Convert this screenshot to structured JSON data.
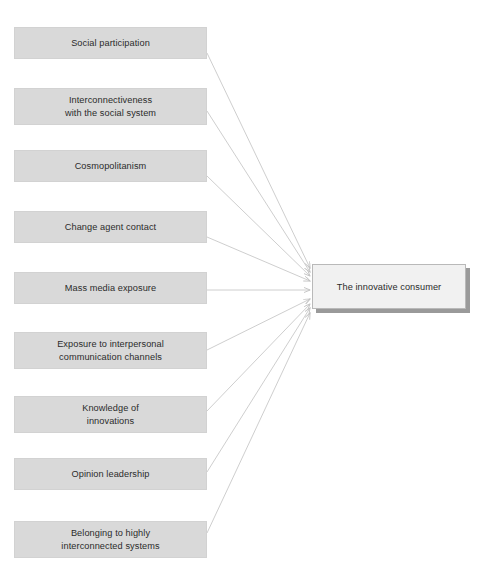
{
  "diagram": {
    "type": "convergent-arrow-diagram",
    "title": "The innovative consumer",
    "colors": {
      "antecedent_fill": "#d9d9d9",
      "antecedent_border": "#d2d2d2",
      "outcome_fill": "#f1f1f1",
      "outcome_border": "#b9b9b9",
      "outcome_shadow": "#9a9a9a",
      "arrow": "#c8c8c8",
      "text": "#2b2b2b",
      "background": "#ffffff"
    },
    "outcome": {
      "label": "The innovative consumer",
      "x": 312,
      "y": 264,
      "width": 154,
      "height": 45
    },
    "antecedents": [
      {
        "id": "social-participation",
        "label": "Social participation",
        "x": 14,
        "y": 27,
        "width": 193,
        "height": 32,
        "arrow_from": [
          207,
          53
        ],
        "arrow_to": [
          310,
          268
        ]
      },
      {
        "id": "interconnectiveness-with-the-social-system",
        "label": "Interconnectiveness\nwith the social system",
        "x": 14,
        "y": 88,
        "width": 193,
        "height": 37,
        "arrow_from": [
          207,
          111
        ],
        "arrow_to": [
          310,
          272
        ]
      },
      {
        "id": "cosmopolitanism",
        "label": "Cosmopolitanism",
        "x": 14,
        "y": 150,
        "width": 193,
        "height": 32,
        "arrow_from": [
          207,
          176
        ],
        "arrow_to": [
          310,
          276
        ]
      },
      {
        "id": "change-agent-contact",
        "label": "Change agent contact",
        "x": 14,
        "y": 211,
        "width": 193,
        "height": 32,
        "arrow_from": [
          207,
          237
        ],
        "arrow_to": [
          310,
          281
        ]
      },
      {
        "id": "mass-media-exposure",
        "label": "Mass media exposure",
        "x": 14,
        "y": 272,
        "width": 193,
        "height": 32,
        "arrow_from": [
          207,
          290
        ],
        "arrow_to": [
          310,
          290
        ]
      },
      {
        "id": "exposure-to-interpersonal-communication-channels",
        "label": "Exposure to interpersonal\ncommunication channels",
        "x": 14,
        "y": 332,
        "width": 193,
        "height": 37,
        "arrow_from": [
          207,
          350
        ],
        "arrow_to": [
          310,
          299
        ]
      },
      {
        "id": "knowledge-of-innovations",
        "label": "Knowledge of\ninnovations",
        "x": 14,
        "y": 396,
        "width": 193,
        "height": 37,
        "arrow_from": [
          207,
          411
        ],
        "arrow_to": [
          310,
          304
        ]
      },
      {
        "id": "opinion-leadership",
        "label": "Opinion leadership",
        "x": 14,
        "y": 458,
        "width": 193,
        "height": 32,
        "arrow_from": [
          207,
          472
        ],
        "arrow_to": [
          310,
          308
        ]
      },
      {
        "id": "belonging-to-highly-interconnected-systems",
        "label": "Belonging to highly\ninterconnected systems",
        "x": 14,
        "y": 521,
        "width": 193,
        "height": 37,
        "arrow_from": [
          207,
          533
        ],
        "arrow_to": [
          310,
          313
        ]
      }
    ]
  },
  "caption": {
    "text": ""
  }
}
